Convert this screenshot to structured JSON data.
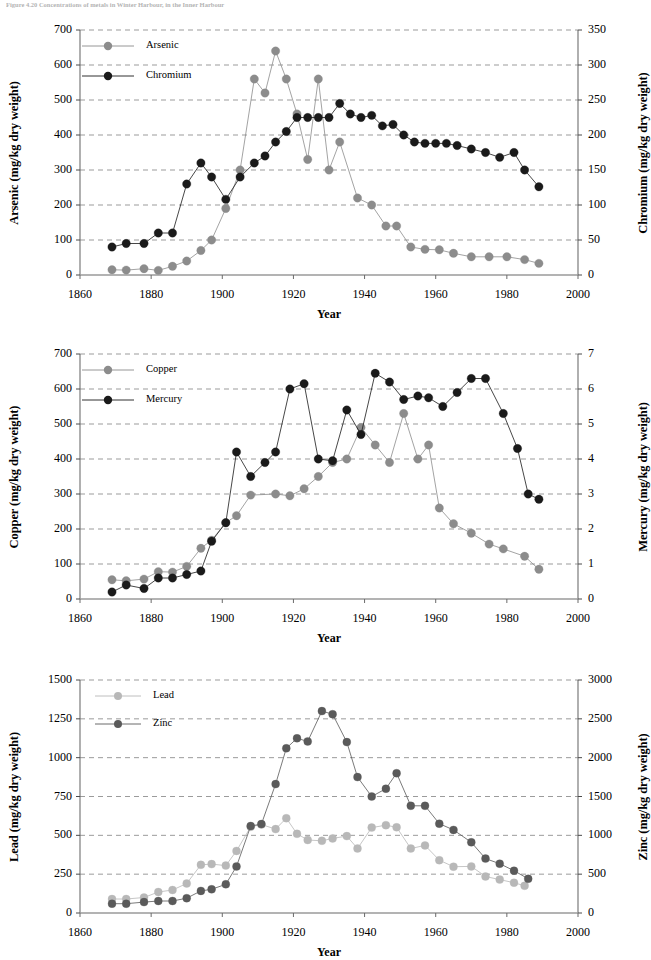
{
  "figure": {
    "caption": "Figure 4.20   Concentrations of metals in Winter Harbour, in the Inner Harbour"
  },
  "panels": [
    {
      "id": "panel-arsenic-chromium",
      "x_axis": {
        "label": "Year",
        "min": 1860,
        "max": 2000,
        "ticks": [
          1860,
          1880,
          1900,
          1920,
          1940,
          1960,
          1980,
          2000
        ]
      },
      "y_left": {
        "label": "Arsenic (mg/kg dry weight)",
        "min": 0,
        "max": 700,
        "ticks": [
          0,
          100,
          200,
          300,
          400,
          500,
          600,
          700
        ]
      },
      "y_right": {
        "label": "Chromium (mg/kg dry weight)",
        "min": 0,
        "max": 350,
        "ticks": [
          0,
          50,
          100,
          150,
          200,
          250,
          300,
          350
        ]
      },
      "legend": [
        {
          "label": "Arsenic",
          "color": "#8c8c8c"
        },
        {
          "label": "Chromium",
          "color": "#1a1a1a"
        }
      ]
    },
    {
      "id": "panel-copper-mercury",
      "x_axis": {
        "label": "Year",
        "min": 1860,
        "max": 2000,
        "ticks": [
          1860,
          1880,
          1900,
          1920,
          1940,
          1960,
          1980,
          2000
        ]
      },
      "y_left": {
        "label": "Copper (mg/kg dry weight)",
        "min": 0,
        "max": 700,
        "ticks": [
          0,
          100,
          200,
          300,
          400,
          500,
          600,
          700
        ]
      },
      "y_right": {
        "label": "Mercury (mg/kg dry weight)",
        "min": 0,
        "max": 7,
        "ticks": [
          0,
          1,
          2,
          3,
          4,
          5,
          6,
          7
        ]
      },
      "legend": [
        {
          "label": "Copper",
          "color": "#8c8c8c"
        },
        {
          "label": "Mercury",
          "color": "#1a1a1a"
        }
      ]
    },
    {
      "id": "panel-lead-zinc",
      "x_axis": {
        "label": "Year",
        "min": 1860,
        "max": 2000,
        "ticks": [
          1860,
          1880,
          1900,
          1920,
          1940,
          1960,
          1980,
          2000
        ]
      },
      "y_left": {
        "label": "Lead (mg/kg dry weight)",
        "min": 0,
        "max": 1500,
        "ticks": [
          0,
          250,
          500,
          750,
          1000,
          1250,
          1500
        ]
      },
      "y_right": {
        "label": "Zinc (mg/kg dry weight)",
        "min": 0,
        "max": 3000,
        "ticks": [
          0,
          500,
          1000,
          1500,
          2000,
          2500,
          3000
        ]
      },
      "legend": [
        {
          "label": "Lead",
          "color": "#b8b8b8"
        },
        {
          "label": "Zinc",
          "color": "#5a5a5a"
        }
      ]
    }
  ],
  "chart_data": [
    {
      "type": "line",
      "title": "",
      "xlabel": "Year",
      "ylabel": "Arsenic (mg/kg dry weight)",
      "y2label": "Chromium (mg/kg dry weight)",
      "xlim": [
        1860,
        2000
      ],
      "ylim": [
        0,
        700
      ],
      "y2lim": [
        0,
        350
      ],
      "grid": true,
      "legend_position": "upper-left-inside",
      "series": [
        {
          "name": "Arsenic",
          "axis": "left",
          "color": "#8c8c8c",
          "x": [
            1869,
            1873,
            1878,
            1882,
            1886,
            1890,
            1894,
            1897,
            1901,
            1905,
            1909,
            1912,
            1915,
            1918,
            1921,
            1924,
            1927,
            1930,
            1933,
            1938,
            1942,
            1946,
            1949,
            1953,
            1957,
            1961,
            1965,
            1970,
            1975,
            1980,
            1985,
            1989
          ],
          "y": [
            15,
            14,
            18,
            13,
            25,
            40,
            70,
            100,
            190,
            300,
            560,
            520,
            640,
            560,
            460,
            330,
            560,
            300,
            380,
            220,
            200,
            140,
            140,
            80,
            73,
            72,
            62,
            52,
            52,
            52,
            44,
            33
          ]
        },
        {
          "name": "Chromium",
          "axis": "right",
          "color": "#1a1a1a",
          "x": [
            1869,
            1873,
            1878,
            1882,
            1886,
            1890,
            1894,
            1897,
            1901,
            1905,
            1909,
            1912,
            1915,
            1918,
            1921,
            1924,
            1927,
            1930,
            1933,
            1936,
            1939,
            1942,
            1945,
            1948,
            1951,
            1954,
            1957,
            1960,
            1963,
            1966,
            1970,
            1974,
            1978,
            1982,
            1985,
            1989
          ],
          "y": [
            40,
            45,
            45,
            60,
            60,
            130,
            160,
            140,
            108,
            140,
            160,
            170,
            190,
            205,
            225,
            225,
            225,
            225,
            245,
            230,
            225,
            228,
            213,
            215,
            200,
            190,
            188,
            188,
            188,
            185,
            180,
            175,
            168,
            175,
            150,
            126
          ]
        }
      ]
    },
    {
      "type": "line",
      "title": "",
      "xlabel": "Year",
      "ylabel": "Copper (mg/kg dry weight)",
      "y2label": "Mercury (mg/kg dry weight)",
      "xlim": [
        1860,
        2000
      ],
      "ylim": [
        0,
        700
      ],
      "y2lim": [
        0,
        7
      ],
      "grid": true,
      "legend_position": "upper-left-inside",
      "series": [
        {
          "name": "Copper",
          "axis": "left",
          "color": "#8c8c8c",
          "x": [
            1869,
            1873,
            1878,
            1882,
            1886,
            1890,
            1894,
            1897,
            1901,
            1904,
            1908,
            1915,
            1919,
            1923,
            1927,
            1931,
            1935,
            1939,
            1943,
            1947,
            1951,
            1955,
            1958,
            1961,
            1965,
            1970,
            1975,
            1979,
            1985,
            1989
          ],
          "y": [
            55,
            52,
            57,
            78,
            77,
            93,
            145,
            168,
            218,
            238,
            297,
            300,
            295,
            315,
            350,
            390,
            400,
            490,
            440,
            390,
            530,
            400,
            440,
            260,
            215,
            188,
            157,
            143,
            122,
            85
          ]
        },
        {
          "name": "Mercury",
          "axis": "right",
          "color": "#1a1a1a",
          "x": [
            1869,
            1873,
            1878,
            1882,
            1886,
            1890,
            1894,
            1897,
            1901,
            1904,
            1908,
            1912,
            1915,
            1919,
            1923,
            1927,
            1931,
            1935,
            1939,
            1943,
            1947,
            1951,
            1955,
            1958,
            1962,
            1966,
            1970,
            1974,
            1979,
            1983,
            1986,
            1989
          ],
          "y": [
            0.2,
            0.4,
            0.3,
            0.6,
            0.6,
            0.7,
            0.8,
            1.65,
            2.18,
            4.2,
            3.5,
            3.9,
            4.2,
            6.0,
            6.15,
            4.0,
            3.95,
            5.4,
            4.7,
            6.45,
            6.2,
            5.7,
            5.8,
            5.75,
            5.5,
            5.9,
            6.3,
            6.3,
            5.3,
            4.3,
            3.0,
            2.85
          ]
        }
      ]
    },
    {
      "type": "line",
      "title": "",
      "xlabel": "Year",
      "ylabel": "Lead (mg/kg dry weight)",
      "y2label": "Zinc (mg/kg dry weight)",
      "xlim": [
        1860,
        2000
      ],
      "ylim": [
        0,
        1500
      ],
      "y2lim": [
        0,
        3000
      ],
      "grid": true,
      "legend_position": "upper-left-inside",
      "series": [
        {
          "name": "Lead",
          "axis": "left",
          "color": "#b8b8b8",
          "x": [
            1869,
            1873,
            1878,
            1882,
            1886,
            1890,
            1894,
            1897,
            1901,
            1904,
            1908,
            1911,
            1915,
            1918,
            1921,
            1924,
            1928,
            1931,
            1935,
            1938,
            1942,
            1946,
            1949,
            1953,
            1957,
            1961,
            1965,
            1970,
            1974,
            1978,
            1982,
            1985
          ],
          "y": [
            90,
            90,
            100,
            135,
            148,
            190,
            310,
            315,
            305,
            400,
            555,
            570,
            540,
            610,
            510,
            470,
            465,
            480,
            495,
            415,
            550,
            565,
            552,
            415,
            435,
            340,
            298,
            300,
            235,
            215,
            195,
            175
          ]
        },
        {
          "name": "Zinc",
          "axis": "right",
          "color": "#5a5a5a",
          "x": [
            1869,
            1873,
            1878,
            1882,
            1886,
            1890,
            1894,
            1897,
            1901,
            1904,
            1908,
            1911,
            1915,
            1918,
            1921,
            1924,
            1928,
            1931,
            1935,
            1938,
            1942,
            1946,
            1949,
            1953,
            1957,
            1961,
            1965,
            1970,
            1974,
            1978,
            1982,
            1986
          ],
          "y": [
            120,
            120,
            140,
            155,
            155,
            190,
            285,
            305,
            370,
            600,
            1120,
            1145,
            1660,
            2120,
            2250,
            2210,
            2600,
            2560,
            2200,
            1750,
            1500,
            1600,
            1800,
            1380,
            1380,
            1150,
            1070,
            910,
            700,
            635,
            545,
            440
          ]
        }
      ]
    }
  ]
}
